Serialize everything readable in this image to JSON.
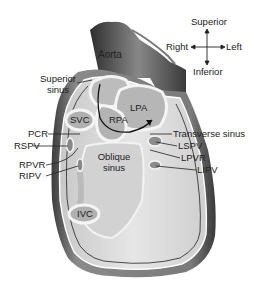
{
  "compass": {
    "superior": "Superior",
    "inferior": "Inferior",
    "right": "Right",
    "left": "Left"
  },
  "structures": {
    "aorta": "Aorta",
    "svc": "SVC",
    "rpa": "RPA",
    "lpa": "LPA",
    "oblique_sinus_1": "Oblique",
    "oblique_sinus_2": "sinus",
    "ivc": "IVC"
  },
  "left_labels": {
    "superior_sinus_1": "Superior",
    "superior_sinus_2": "sinus",
    "pcr": "PCR",
    "rspv": "RSPV",
    "rpvr": "RPVR",
    "ripv": "RIPV"
  },
  "right_labels": {
    "transverse_sinus": "Transverse sinus",
    "lspv": "LSPV",
    "lpvr": "LPVR",
    "lipv": "LIPV"
  },
  "colors": {
    "pericardium_dark": "#4a4a4a",
    "pericardium_mid": "#9a9a9a",
    "cavity": "#d6d6d6",
    "vessel": "#b9b9b9",
    "line": "#111111"
  }
}
